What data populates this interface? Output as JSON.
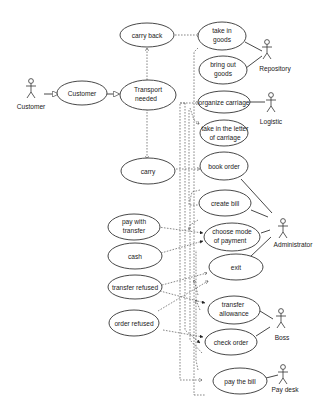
{
  "diagram": {
    "type": "use-case",
    "actors": [
      {
        "id": "customer",
        "label": "Customer"
      },
      {
        "id": "repository",
        "label": "Repository"
      },
      {
        "id": "logistic",
        "label": "Logistic"
      },
      {
        "id": "administrator",
        "label": "Administrator"
      },
      {
        "id": "boss",
        "label": "Boss"
      },
      {
        "id": "paydesk",
        "label": "Pay desk"
      }
    ],
    "use_cases": [
      {
        "id": "customer_uc",
        "lines": [
          "Customer"
        ]
      },
      {
        "id": "carry_back",
        "lines": [
          "carry back"
        ]
      },
      {
        "id": "transport_needed",
        "lines": [
          "Transport",
          "needed"
        ]
      },
      {
        "id": "carry",
        "lines": [
          "carry"
        ]
      },
      {
        "id": "take_in_goods",
        "lines": [
          "take in",
          "goods"
        ]
      },
      {
        "id": "bring_out_goods",
        "lines": [
          "bring out",
          "goods"
        ]
      },
      {
        "id": "organize_carriage",
        "lines": [
          "organize carriage"
        ]
      },
      {
        "id": "take_in_letter",
        "lines": [
          "take in the letter",
          "of carriage"
        ]
      },
      {
        "id": "book_order",
        "lines": [
          "book order"
        ]
      },
      {
        "id": "create_bill",
        "lines": [
          "create bill"
        ]
      },
      {
        "id": "pay_with_transfer",
        "lines": [
          "pay with",
          "transfer"
        ]
      },
      {
        "id": "cash",
        "lines": [
          "cash"
        ]
      },
      {
        "id": "choose_mode",
        "lines": [
          "choose mode",
          "of payment"
        ]
      },
      {
        "id": "exit",
        "lines": [
          "exit"
        ]
      },
      {
        "id": "transfer_refused",
        "lines": [
          "transfer refused"
        ]
      },
      {
        "id": "order_refused",
        "lines": [
          "order refused"
        ]
      },
      {
        "id": "transfer_allowance",
        "lines": [
          "transfer",
          "allowance"
        ]
      },
      {
        "id": "check_order",
        "lines": [
          "check order"
        ]
      },
      {
        "id": "pay_the_bill",
        "lines": [
          "pay the bill"
        ]
      }
    ],
    "associations": [
      [
        "repository",
        "take_in_goods"
      ],
      [
        "repository",
        "bring_out_goods"
      ],
      [
        "logistic",
        "organize_carriage"
      ],
      [
        "administrator",
        "book_order"
      ],
      [
        "administrator",
        "create_bill"
      ],
      [
        "administrator",
        "choose_mode"
      ],
      [
        "administrator",
        "exit"
      ],
      [
        "boss",
        "transfer_allowance"
      ],
      [
        "boss",
        "check_order"
      ],
      [
        "paydesk",
        "pay_the_bill"
      ]
    ],
    "generalizations": [
      [
        "customer",
        "customer_uc"
      ],
      [
        "customer_uc",
        "transport_needed"
      ]
    ],
    "dependencies": [
      [
        "transport_needed",
        "carry_back"
      ],
      [
        "transport_needed",
        "carry"
      ],
      [
        "carry_back",
        "take_in_goods"
      ],
      [
        "carry",
        "book_order"
      ],
      [
        "pay_with_transfer",
        "choose_mode"
      ],
      [
        "cash",
        "choose_mode"
      ],
      [
        "transfer_refused",
        "exit"
      ],
      [
        "transfer_refused",
        "transfer_allowance"
      ],
      [
        "order_refused",
        "exit"
      ],
      [
        "order_refused",
        "check_order"
      ]
    ]
  }
}
